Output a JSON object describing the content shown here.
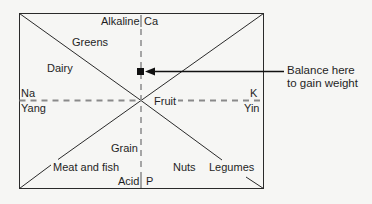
{
  "diagram": {
    "axes": {
      "top": {
        "left": "Alkaline",
        "right": "Ca"
      },
      "bottom": {
        "left": "Acid",
        "right": "P"
      },
      "left": {
        "top": "Na",
        "bottom": "Yang"
      },
      "right": {
        "top": "K",
        "bottom": "Yin"
      }
    },
    "regions": {
      "greens": "Greens",
      "dairy": "Dairy",
      "fruit": "Fruit",
      "grain": "Grain",
      "meat_and_fish": "Meat and fish",
      "nuts": "Nuts",
      "legumes": "Legumes"
    },
    "marker": {
      "label_line1": "Balance here",
      "label_line2": "to gain weight",
      "color": "#111111"
    },
    "colors": {
      "line": "#2a2a2a",
      "dashed": "#8a8a8a",
      "background": "#f6f6f4"
    }
  }
}
